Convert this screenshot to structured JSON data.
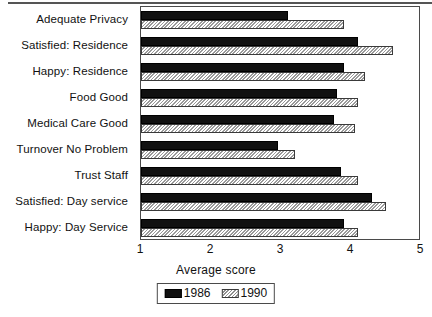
{
  "chart_data": {
    "type": "bar",
    "orientation": "horizontal",
    "title": "",
    "xlabel": "Average score",
    "ylabel": "",
    "xlim": [
      1,
      5
    ],
    "xticks": [
      "1",
      "2",
      "3",
      "4",
      "5"
    ],
    "grid": false,
    "legend_position": "bottom-center",
    "categories": [
      "Adequate Privacy",
      "Satisfied: Residence",
      "Happy: Residence",
      "Food Good",
      "Medical Care Good",
      "Turnover No Problem",
      "Trust Staff",
      "Satisfied: Day service",
      "Happy: Day Service"
    ],
    "series": [
      {
        "name": "1986",
        "color": "#111111",
        "pattern": "solid",
        "values": [
          3.1,
          4.1,
          3.9,
          3.8,
          3.75,
          2.95,
          3.85,
          4.3,
          3.9
        ]
      },
      {
        "name": "1990",
        "color": "#d8d8d8",
        "pattern": "hatched",
        "values": [
          3.9,
          4.6,
          4.2,
          4.1,
          4.05,
          3.2,
          4.1,
          4.5,
          4.1
        ]
      }
    ]
  },
  "axis": {
    "x_title": "Average score",
    "ticks": [
      "1",
      "2",
      "3",
      "4",
      "5"
    ]
  },
  "legend": {
    "entries": [
      {
        "label": "1986",
        "swatch": "black-solid-swatch"
      },
      {
        "label": "1990",
        "swatch": "hatched-swatch"
      }
    ]
  }
}
